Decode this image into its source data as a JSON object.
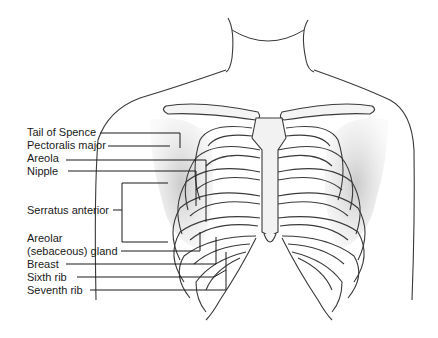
{
  "figure": {
    "colors": {
      "background": "#ffffff",
      "ink": "#1a1a1a",
      "shade": "#cfcfcf"
    }
  },
  "labels": [
    {
      "id": "tail-of-spence",
      "text": "Tail of Spence"
    },
    {
      "id": "pectoralis-major",
      "text": "Pectoralis major"
    },
    {
      "id": "areola",
      "text": "Areola"
    },
    {
      "id": "nipple",
      "text": "Nipple"
    },
    {
      "id": "serratus-anterior",
      "text": "Serratus anterior"
    },
    {
      "id": "areolar-gland-line1",
      "text": "Areolar"
    },
    {
      "id": "areolar-gland-line2",
      "text": "(sebaceous) gland"
    },
    {
      "id": "breast",
      "text": "Breast"
    },
    {
      "id": "sixth-rib",
      "text": "Sixth rib"
    },
    {
      "id": "seventh-rib",
      "text": "Seventh rib"
    }
  ]
}
